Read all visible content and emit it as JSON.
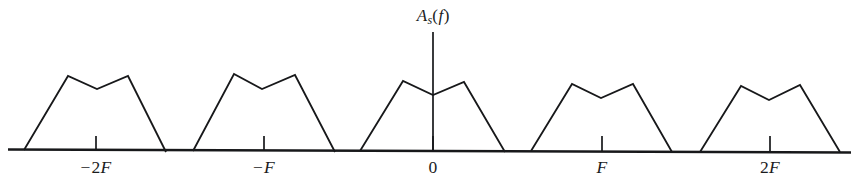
{
  "figure": {
    "kind": "signal-spectrum-diagram",
    "axis_title": {
      "symbol": "A",
      "subscript": "s",
      "open_paren": "(",
      "argument": "f",
      "close_paren": ")",
      "plain": "A_s(f)"
    },
    "ink_color": "#17181a",
    "background_color": "#ffffff"
  },
  "axis": {
    "horizontal": {
      "x1": 8,
      "x2": 851,
      "y1": 149.5,
      "y2": 152.5
    },
    "vertical": {
      "x": 433,
      "y_top": 32,
      "y_bottom": 152
    },
    "title_position": {
      "x": 433,
      "y": 6
    }
  },
  "ticks": [
    {
      "name": "tick-minus-2F",
      "x": 96,
      "y_top": 136,
      "y_bottom": 150,
      "label": {
        "sign": "−",
        "number": "2",
        "variable": "F"
      },
      "label_text": "−2F",
      "label_x": 96,
      "label_y": 157
    },
    {
      "name": "tick-minus-F",
      "x": 264,
      "y_top": 136,
      "y_bottom": 151,
      "label": {
        "sign": "−",
        "number": "",
        "variable": "F"
      },
      "label_text": "−F",
      "label_x": 264,
      "label_y": 157
    },
    {
      "name": "tick-zero",
      "x": 433,
      "y_top": 136,
      "y_bottom": 152,
      "label": {
        "sign": "",
        "number": "0",
        "variable": ""
      },
      "label_text": "0",
      "label_x": 433,
      "label_y": 157
    },
    {
      "name": "tick-F",
      "x": 602,
      "y_top": 136,
      "y_bottom": 152,
      "label": {
        "sign": "",
        "number": "",
        "variable": "F"
      },
      "label_text": "F",
      "label_x": 602,
      "label_y": 157
    },
    {
      "name": "tick-2F",
      "x": 770,
      "y_top": 136,
      "y_bottom": 152,
      "label": {
        "sign": "",
        "number": "2",
        "variable": "F"
      },
      "label_text": "2F",
      "label_x": 770,
      "label_y": 157
    }
  ],
  "chart_data": {
    "type": "line",
    "xlabel": "",
    "ylabel": "A_s(f)",
    "grid": false,
    "legend": null,
    "xlim": [
      8,
      851
    ],
    "ylim": [
      150,
      32
    ],
    "xtick_values": [
      "-2F",
      "-F",
      "0",
      "F",
      "2F"
    ],
    "xtick_pixels": [
      96,
      264,
      433,
      602,
      770
    ],
    "series": [
      {
        "name": "replica-minus-2F",
        "center_label": "-2F",
        "points": [
          [
            24,
            150
          ],
          [
            68,
            76
          ],
          [
            97,
            89
          ],
          [
            128,
            76
          ],
          [
            166,
            152
          ]
        ]
      },
      {
        "name": "replica-minus-F",
        "center_label": "-F",
        "points": [
          [
            193,
            151
          ],
          [
            234,
            74
          ],
          [
            262,
            89
          ],
          [
            295,
            75
          ],
          [
            335,
            152
          ]
        ]
      },
      {
        "name": "replica-zero",
        "center_label": "0",
        "points": [
          [
            360,
            151
          ],
          [
            403,
            81
          ],
          [
            433,
            95
          ],
          [
            464,
            82
          ],
          [
            505,
            152
          ]
        ]
      },
      {
        "name": "replica-F",
        "center_label": "F",
        "points": [
          [
            531,
            151
          ],
          [
            572,
            84
          ],
          [
            601,
            98
          ],
          [
            633,
            84
          ],
          [
            672,
            152
          ]
        ]
      },
      {
        "name": "replica-2F",
        "center_label": "2F",
        "points": [
          [
            700,
            152
          ],
          [
            741,
            86
          ],
          [
            769,
            100
          ],
          [
            800,
            85
          ],
          [
            840,
            152
          ]
        ]
      }
    ]
  }
}
